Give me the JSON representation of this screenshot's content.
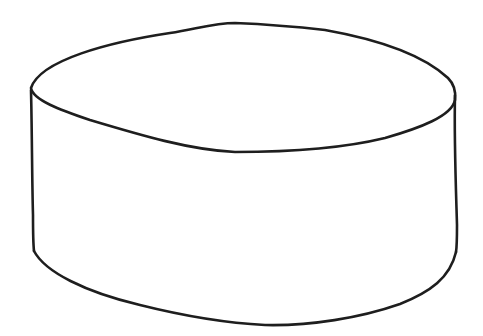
{
  "drawing": {
    "subject": "cylinder",
    "style": "hand-drawn line sketch",
    "background_color": "#ffffff",
    "stroke_color": "#1e1e1e"
  }
}
